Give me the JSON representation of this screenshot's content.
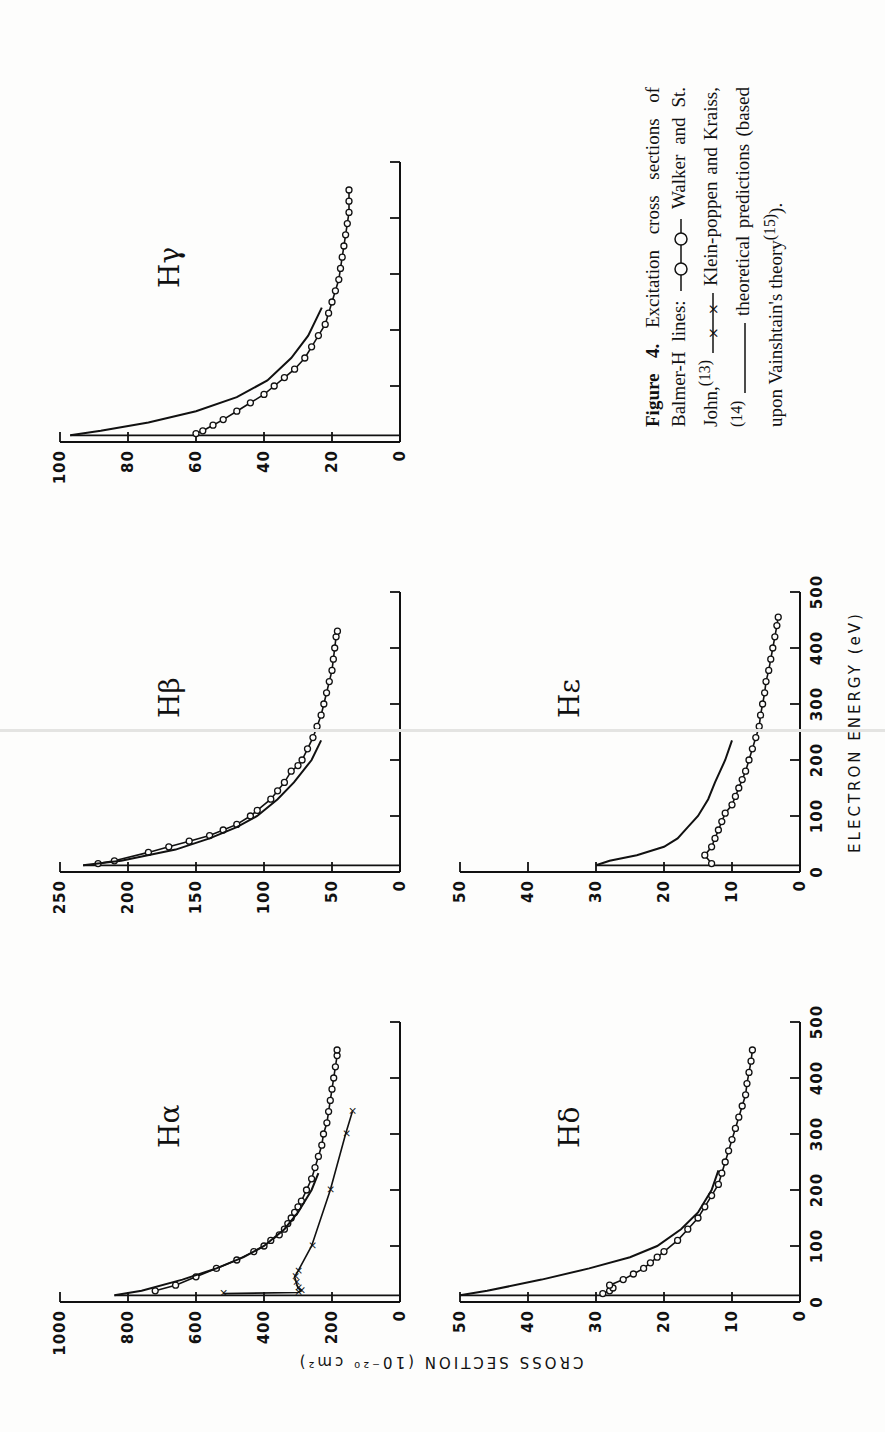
{
  "figure": {
    "y_axis_label": "CROSS SECTION (10⁻²⁰ cm²)",
    "x_axis_label": "ELECTRON ENERGY (eV)",
    "caption": {
      "label": "Figure 4.",
      "text_1": "Excitation cross sections of Balmer-H lines:",
      "legend_walker": "Walker and St. John,",
      "ref_walker": "(13)",
      "legend_klein": "Klein-poppen and Kraiss,",
      "ref_klein": "(14)",
      "legend_theory": "theoretical predictions (based upon Vainshtain's theory",
      "ref_theory": "(15)",
      "end": ")."
    }
  },
  "chart_data": [
    {
      "type": "line",
      "title": "Hα",
      "panel": "H-alpha",
      "xlabel": "ELECTRON ENERGY (eV)",
      "ylabel": "CROSS SECTION (10^-20 cm^2)",
      "xlim": [
        0,
        500
      ],
      "ylim": [
        0,
        1000
      ],
      "xticks": [
        "0",
        "100",
        "200",
        "300",
        "400",
        "500"
      ],
      "yticks": [
        "0",
        "200",
        "400",
        "600",
        "800",
        "1000"
      ],
      "series": [
        {
          "name": "Walker and St. John",
          "marker": "circle",
          "x": [
            20,
            30,
            45,
            60,
            75,
            90,
            100,
            110,
            120,
            130,
            140,
            150,
            160,
            170,
            180,
            200,
            220,
            240,
            260,
            280,
            300,
            320,
            340,
            360,
            380,
            400,
            420,
            440,
            450
          ],
          "y": [
            720,
            660,
            600,
            540,
            480,
            430,
            400,
            380,
            355,
            340,
            330,
            320,
            310,
            300,
            290,
            275,
            260,
            250,
            240,
            230,
            225,
            215,
            210,
            205,
            200,
            195,
            190,
            185,
            185
          ]
        },
        {
          "name": "Kleinpoppen and Kraiss",
          "marker": "x",
          "x": [
            15,
            17,
            20,
            25,
            35,
            45,
            55,
            100,
            200,
            300,
            340
          ],
          "y": [
            520,
            300,
            290,
            300,
            305,
            310,
            300,
            260,
            205,
            160,
            140
          ]
        },
        {
          "name": "Theory (Vainshtain)",
          "marker": "none",
          "x": [
            12,
            20,
            40,
            60,
            80,
            100,
            130,
            160,
            200,
            230
          ],
          "y": [
            840,
            760,
            640,
            540,
            460,
            400,
            340,
            300,
            260,
            240
          ]
        }
      ]
    },
    {
      "type": "line",
      "title": "Hβ",
      "panel": "H-beta",
      "xlim": [
        0,
        500
      ],
      "ylim": [
        0,
        250
      ],
      "xticks": [
        "0",
        "100",
        "200",
        "300",
        "400",
        "500"
      ],
      "yticks": [
        "0",
        "50",
        "100",
        "150",
        "200",
        "250"
      ],
      "series": [
        {
          "name": "Walker and St. John",
          "marker": "circle",
          "x": [
            15,
            20,
            35,
            45,
            55,
            65,
            75,
            85,
            100,
            110,
            130,
            145,
            160,
            180,
            190,
            200,
            220,
            240,
            260,
            280,
            300,
            320,
            340,
            360,
            380,
            400,
            420,
            430
          ],
          "y": [
            222,
            210,
            185,
            170,
            155,
            140,
            130,
            120,
            110,
            105,
            95,
            90,
            85,
            80,
            75,
            72,
            68,
            64,
            61,
            58,
            56,
            54,
            52,
            50,
            49,
            48,
            47,
            46
          ]
        },
        {
          "name": "Theory (Vainshtain)",
          "marker": "none",
          "x": [
            12,
            20,
            40,
            60,
            80,
            100,
            130,
            160,
            200,
            235
          ],
          "y": [
            233,
            205,
            165,
            140,
            120,
            105,
            90,
            78,
            65,
            58
          ]
        }
      ]
    },
    {
      "type": "line",
      "title": "Hγ",
      "panel": "H-gamma",
      "xlim": [
        0,
        500
      ],
      "ylim": [
        0,
        100
      ],
      "xticks": [
        "0",
        "100",
        "200",
        "300",
        "400",
        "500"
      ],
      "yticks": [
        "0",
        "20",
        "40",
        "60",
        "80",
        "100"
      ],
      "series": [
        {
          "name": "Walker and St. John",
          "marker": "circle",
          "x": [
            15,
            20,
            30,
            40,
            55,
            70,
            85,
            100,
            115,
            130,
            150,
            170,
            190,
            210,
            230,
            250,
            270,
            290,
            310,
            330,
            350,
            370,
            390,
            410,
            430,
            450
          ],
          "y": [
            60,
            58,
            55,
            52,
            48,
            44,
            40,
            37,
            34,
            31,
            28,
            26,
            24,
            22,
            21,
            20,
            19,
            18,
            17.5,
            17,
            16.5,
            16,
            15.5,
            15,
            15,
            15
          ]
        },
        {
          "name": "Theory (Vainshtain)",
          "marker": "none",
          "x": [
            12,
            20,
            35,
            55,
            80,
            110,
            150,
            190,
            240
          ],
          "y": [
            97,
            88,
            74,
            60,
            48,
            39,
            32,
            27,
            23
          ]
        }
      ]
    },
    {
      "type": "line",
      "title": "Hδ",
      "panel": "H-delta",
      "xlim": [
        0,
        500
      ],
      "ylim": [
        0,
        50
      ],
      "xticks": [
        "0",
        "100",
        "200",
        "300",
        "400",
        "500"
      ],
      "yticks": [
        "0",
        "10",
        "20",
        "30",
        "40",
        "50"
      ],
      "series": [
        {
          "name": "Walker and St. John",
          "marker": "circle",
          "x": [
            15,
            20,
            25,
            30,
            40,
            50,
            60,
            70,
            80,
            90,
            110,
            130,
            150,
            170,
            190,
            210,
            230,
            250,
            270,
            290,
            310,
            330,
            350,
            370,
            390,
            410,
            430,
            450
          ],
          "y": [
            29,
            28,
            27.5,
            28,
            26,
            24.5,
            23,
            22,
            21,
            20,
            18,
            16.5,
            15,
            14,
            13,
            12,
            11.5,
            11,
            10.5,
            10,
            9.5,
            9,
            8.5,
            8,
            7.8,
            7.5,
            7.2,
            7
          ]
        },
        {
          "name": "Theory (Vainshtain)",
          "marker": "none",
          "x": [
            12,
            20,
            40,
            60,
            80,
            100,
            130,
            160,
            200,
            235
          ],
          "y": [
            50,
            46,
            38,
            31,
            25,
            21,
            17.5,
            15,
            13,
            12
          ]
        }
      ]
    },
    {
      "type": "line",
      "title": "Hε",
      "panel": "H-epsilon",
      "xlim": [
        0,
        500
      ],
      "ylim": [
        0,
        50
      ],
      "xticks": [
        "0",
        "100",
        "200",
        "300",
        "400",
        "500"
      ],
      "yticks": [
        "0",
        "10",
        "20",
        "30",
        "40",
        "50"
      ],
      "series": [
        {
          "name": "Walker and St. John",
          "marker": "circle",
          "x": [
            15,
            30,
            45,
            60,
            75,
            90,
            105,
            120,
            135,
            150,
            165,
            180,
            200,
            220,
            240,
            260,
            280,
            300,
            320,
            340,
            360,
            380,
            400,
            420,
            440,
            455
          ],
          "y": [
            13,
            14,
            13,
            12.5,
            12,
            11.5,
            11,
            10,
            9.5,
            9,
            8.5,
            8,
            7.5,
            7,
            6.5,
            6,
            5.8,
            5.5,
            5.2,
            5,
            4.6,
            4.3,
            4,
            3.7,
            3.4,
            3.2
          ]
        },
        {
          "name": "Theory (Vainshtain)",
          "marker": "none",
          "x": [
            12,
            20,
            30,
            45,
            60,
            80,
            100,
            130,
            160,
            200,
            235
          ],
          "y": [
            30,
            28,
            24,
            20,
            18,
            16.5,
            15,
            13.5,
            12.5,
            11,
            10
          ]
        }
      ]
    }
  ]
}
